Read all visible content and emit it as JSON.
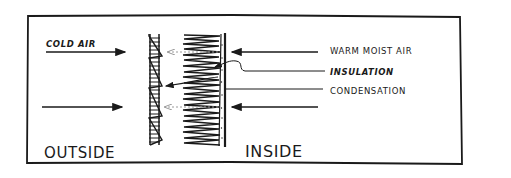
{
  "diagram": {
    "type": "cross-section",
    "labels": {
      "cold_air": "COLD AIR",
      "warm_moist_air": "WARM MOIST AIR",
      "insulation": "INSULATION",
      "condensation": "CONDENSATION",
      "outside": "OUTSIDE",
      "inside": "INSIDE"
    },
    "colors": {
      "ink": "#1a1a1a",
      "dashed_arrow": "#9a9a9a",
      "background": "#ffffff"
    },
    "elements": [
      {
        "name": "siding",
        "description": "lapped exterior siding with hatched sheathing"
      },
      {
        "name": "insulation",
        "description": "zigzag batt insulation"
      },
      {
        "name": "interior-wall",
        "description": "vapor barrier / drywall line with condensation dots"
      }
    ],
    "arrows": [
      {
        "from": "outside",
        "label": "COLD AIR",
        "direction": "right"
      },
      {
        "from": "outside",
        "direction": "right"
      },
      {
        "from": "inside",
        "label": "WARM MOIST AIR",
        "direction": "left"
      },
      {
        "from": "inside",
        "direction": "left"
      }
    ]
  }
}
